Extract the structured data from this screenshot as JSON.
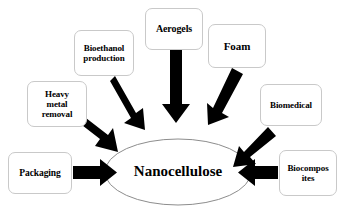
{
  "diagram": {
    "type": "hub-and-spoke",
    "title_text": "Nanocellulose",
    "background_color": "#ffffff",
    "arrow_color": "#000000",
    "box_border_color": "#c9c9c9",
    "ellipse_border_color": "#8d8d8d",
    "center": {
      "label": "Nanocellulose",
      "shape": "ellipse",
      "cx": 178,
      "cy": 172,
      "rx": 73,
      "ry": 33,
      "font_size": 15
    },
    "nodes": [
      {
        "id": "packaging",
        "label": "Packaging",
        "lines": [
          "Packaging"
        ],
        "x": 8,
        "y": 152,
        "w": 64,
        "h": 42,
        "font_size": 9.5
      },
      {
        "id": "heavy-metal-removal",
        "label": "Heavy metal removal",
        "lines": [
          "Heavy",
          "metal",
          "removal"
        ],
        "x": 27,
        "y": 81,
        "w": 60,
        "h": 46,
        "font_size": 9
      },
      {
        "id": "bioethanol-production",
        "label": "Bioethanol production",
        "lines": [
          "Bioethanol",
          "production"
        ],
        "x": 74,
        "y": 30,
        "w": 60,
        "h": 46,
        "font_size": 9
      },
      {
        "id": "aerogels",
        "label": "Aerogels",
        "lines": [
          "Aerogels"
        ],
        "x": 145,
        "y": 8,
        "w": 58,
        "h": 42,
        "font_size": 10
      },
      {
        "id": "foam",
        "label": "Foam",
        "lines": [
          "Foam"
        ],
        "x": 208,
        "y": 24,
        "w": 58,
        "h": 44,
        "font_size": 11
      },
      {
        "id": "biomedical",
        "label": "Biomedical",
        "lines": [
          "Biomedical"
        ],
        "x": 260,
        "y": 84,
        "w": 62,
        "h": 42,
        "font_size": 9
      },
      {
        "id": "biocomposites",
        "label": "Biocomposites",
        "lines": [
          "Biocompos",
          "ites"
        ],
        "x": 279,
        "y": 150,
        "w": 58,
        "h": 46,
        "font_size": 9
      }
    ],
    "arrows": [
      {
        "id": "arrow-packaging",
        "from": "packaging",
        "to": "center",
        "direction": "right"
      },
      {
        "id": "arrow-heavy-metal-removal",
        "from": "heavy-metal-removal",
        "to": "center",
        "direction": "down-right"
      },
      {
        "id": "arrow-bioethanol",
        "from": "bioethanol-production",
        "to": "center",
        "direction": "down-right-steep"
      },
      {
        "id": "arrow-aerogels",
        "from": "aerogels",
        "to": "center",
        "direction": "down"
      },
      {
        "id": "arrow-foam",
        "from": "foam",
        "to": "center",
        "direction": "down-left-steep"
      },
      {
        "id": "arrow-biomedical",
        "from": "biomedical",
        "to": "center",
        "direction": "down-left"
      },
      {
        "id": "arrow-biocomposites",
        "from": "biocomposites",
        "to": "center",
        "direction": "left"
      }
    ]
  }
}
